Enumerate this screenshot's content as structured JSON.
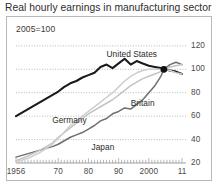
{
  "chart_data": {
    "type": "line",
    "title": "Real hourly earnings in manufacturing sector",
    "subtitle": "2005=100",
    "xlabel": "",
    "ylabel": "",
    "index_base_year": 2005,
    "index_base_value": 100,
    "grid": true,
    "grid_axis": "y",
    "legend_position": "inline-labels",
    "y_axis_side": "right",
    "ylim": [
      20,
      125
    ],
    "yticks": [
      20,
      40,
      60,
      80,
      100,
      120
    ],
    "ytick_labels": [
      "20",
      "40",
      "60",
      "80",
      "100",
      "120"
    ],
    "xlim": [
      1956,
      2011
    ],
    "xticks": [
      1956,
      1970,
      1980,
      1990,
      2000,
      2011
    ],
    "xtick_labels": [
      "1956",
      "70",
      "80",
      "90",
      "2000",
      "11"
    ],
    "marker": {
      "label": "2005 base point",
      "x": 2005,
      "y": 100,
      "color": "#111111"
    },
    "series": [
      {
        "name": "United States",
        "color": "#1a1a1a",
        "label_x": 1986,
        "label_y": 112,
        "x": [
          1956,
          1958,
          1960,
          1962,
          1964,
          1966,
          1968,
          1970,
          1972,
          1974,
          1976,
          1978,
          1980,
          1982,
          1984,
          1986,
          1988,
          1990,
          1992,
          1994,
          1996,
          1998,
          2000,
          2002,
          2004,
          2005,
          2007,
          2009,
          2011
        ],
        "values": [
          60,
          63,
          66,
          69,
          72,
          75,
          78,
          81,
          85,
          88,
          90,
          93,
          95,
          97,
          102,
          104,
          101,
          105,
          109,
          104,
          107,
          105,
          103,
          102,
          101,
          100,
          99,
          98,
          96
        ]
      },
      {
        "name": "Britain",
        "color": "#6e6e6e",
        "label_x": 1994,
        "label_y": 70,
        "x": [
          1956,
          1960,
          1964,
          1968,
          1970,
          1972,
          1974,
          1976,
          1978,
          1980,
          1982,
          1984,
          1986,
          1988,
          1990,
          1992,
          1994,
          1996,
          1998,
          2000,
          2002,
          2004,
          2005,
          2007,
          2009,
          2011
        ],
        "values": [
          25,
          28,
          31,
          34,
          36,
          39,
          42,
          44,
          46,
          49,
          52,
          56,
          58,
          62,
          64,
          67,
          66,
          70,
          74,
          80,
          86,
          94,
          100,
          104,
          106,
          104
        ]
      },
      {
        "name": "Germany",
        "color": "#c4c4c4",
        "label_x": 1968,
        "label_y": 56,
        "x": [
          1956,
          1960,
          1964,
          1968,
          1970,
          1974,
          1978,
          1980,
          1984,
          1988,
          1990,
          1992,
          1994,
          1996,
          1998,
          2000,
          2002,
          2004,
          2005,
          2007,
          2009,
          2011
        ],
        "values": [
          22,
          26,
          31,
          37,
          42,
          50,
          58,
          62,
          68,
          74,
          78,
          82,
          86,
          89,
          92,
          94,
          96,
          98,
          100,
          102,
          103,
          104
        ]
      },
      {
        "name": "Japan",
        "color": "#cfcfcf",
        "label_x": 1981,
        "label_y": 33,
        "x": [
          1956,
          1960,
          1964,
          1968,
          1970,
          1974,
          1978,
          1980,
          1984,
          1988,
          1990,
          1992,
          1994,
          1996,
          1998,
          2000,
          2002,
          2004,
          2005,
          2007,
          2009,
          2011
        ],
        "values": [
          21,
          24,
          29,
          36,
          41,
          52,
          60,
          64,
          72,
          80,
          85,
          90,
          94,
          97,
          99,
          100,
          100,
          100,
          100,
          99,
          97,
          96
        ]
      }
    ]
  }
}
